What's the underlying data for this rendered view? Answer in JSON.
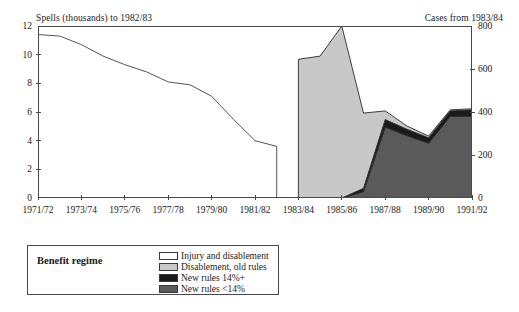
{
  "chart_data": {
    "type": "area",
    "title": "",
    "subtitle": "",
    "left_axis": {
      "label": "Spells (thousands) to 1982/83",
      "ticks": [
        0,
        2,
        4,
        6,
        8,
        10,
        12
      ],
      "ylim": [
        0,
        12
      ],
      "grid": false
    },
    "right_axis": {
      "label": "Cases from 1983/84",
      "ticks": [
        0,
        200,
        400,
        600,
        800
      ],
      "ylim": [
        0,
        800
      ],
      "grid": false
    },
    "xlabel": "",
    "categories": [
      "1971/72",
      "1972/73",
      "1973/74",
      "1974/75",
      "1975/76",
      "1976/77",
      "1977/78",
      "1978/79",
      "1979/80",
      "1980/81",
      "1981/82",
      "1982/83",
      "1983/84",
      "1984/85",
      "1985/86",
      "1986/87",
      "1987/88",
      "1988/89",
      "1989/90",
      "1990/91",
      "1991/92"
    ],
    "xtick_labels": [
      "1971/72",
      "1973/74",
      "1975/76",
      "1977/78",
      "1979/80",
      "1981/82",
      "1983/84",
      "1985/86",
      "1987/88",
      "1989/90",
      "1991/92"
    ],
    "legend": {
      "position": "below-left",
      "title": "Benefit regime",
      "entries": [
        {
          "label": "Injury and disablement",
          "color": "#ffffff"
        },
        {
          "label": "Disablement, old rules",
          "color": "#c8c8c8"
        },
        {
          "label": "New rules 14%+",
          "color": "#1a1a1a"
        },
        {
          "label": "New rules <14%",
          "color": "#5a5a5a"
        }
      ]
    },
    "series": [
      {
        "name": "Injury and disablement",
        "axis": "left",
        "type": "line",
        "units": "spells (thousands)",
        "x": [
          "1971/72",
          "1972/73",
          "1973/74",
          "1974/75",
          "1975/76",
          "1976/77",
          "1977/78",
          "1978/79",
          "1979/80",
          "1980/81",
          "1981/82",
          "1982/83"
        ],
        "values": [
          11.4,
          11.3,
          10.7,
          9.9,
          9.3,
          8.8,
          8.1,
          7.9,
          7.1,
          5.5,
          4.0,
          3.6
        ]
      },
      {
        "name": "Disablement, old rules",
        "axis": "right",
        "type": "area",
        "units": "cases",
        "x": [
          "1983/84",
          "1984/85",
          "1985/86",
          "1986/87",
          "1987/88",
          "1988/89",
          "1989/90",
          "1990/91",
          "1991/92"
        ],
        "values": [
          645,
          660,
          800,
          350,
          40,
          15,
          8,
          5,
          5
        ]
      },
      {
        "name": "New rules 14%+",
        "axis": "right",
        "type": "area",
        "units": "cases",
        "x": [
          "1983/84",
          "1984/85",
          "1985/86",
          "1986/87",
          "1987/88",
          "1988/89",
          "1989/90",
          "1990/91",
          "1991/92"
        ],
        "values": [
          0,
          0,
          0,
          15,
          35,
          30,
          25,
          25,
          30
        ]
      },
      {
        "name": "New rules <14%",
        "axis": "right",
        "type": "area",
        "units": "cases",
        "x": [
          "1983/84",
          "1984/85",
          "1985/86",
          "1986/87",
          "1987/88",
          "1988/89",
          "1989/90",
          "1990/91",
          "1991/92"
        ],
        "values": [
          0,
          0,
          0,
          30,
          330,
          290,
          255,
          380,
          380
        ]
      }
    ],
    "notes": [
      "Left y-axis applies to the line series for years to 1982/83.",
      "Right y-axis applies to the stacked area series from 1983/84."
    ]
  }
}
